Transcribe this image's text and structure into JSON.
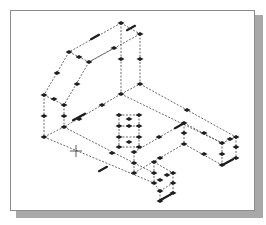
{
  "caption": "",
  "viewport": {
    "frame": {
      "x": 10,
      "y": 10,
      "w": 245,
      "h": 201,
      "border": "#8c8c8c",
      "shadow": "#a8a8a8"
    },
    "edge_color": "#444444",
    "grip_color": "#1e1e1e",
    "cursor": {
      "type": "crosshair",
      "x": 76,
      "y": 151
    }
  },
  "drawing": {
    "description": "Isometric wireframe of a bracket with all edges selected (dashed) showing grips",
    "edges": [
      [
        121,
        23,
        140,
        34
      ],
      [
        121,
        23,
        69,
        52
      ],
      [
        140,
        34,
        140,
        84
      ],
      [
        121,
        23,
        121,
        94
      ],
      [
        69,
        52,
        44,
        95
      ],
      [
        69,
        52,
        89,
        62
      ],
      [
        140,
        34,
        89,
        62
      ],
      [
        114,
        48,
        89,
        62
      ],
      [
        89,
        62,
        64,
        105
      ],
      [
        44,
        95,
        64,
        105
      ],
      [
        44,
        95,
        44,
        137
      ],
      [
        64,
        105,
        64,
        127
      ],
      [
        121,
        94,
        140,
        84
      ],
      [
        121,
        94,
        64,
        127
      ],
      [
        140,
        84,
        236,
        137
      ],
      [
        121,
        94,
        222,
        143
      ],
      [
        44,
        137,
        64,
        127
      ],
      [
        44,
        137,
        154,
        183
      ],
      [
        64,
        127,
        134,
        163
      ],
      [
        184,
        123,
        134,
        152
      ],
      [
        184,
        123,
        184,
        144
      ],
      [
        184,
        144,
        134,
        173
      ],
      [
        222,
        143,
        236,
        137
      ],
      [
        222,
        143,
        222,
        165
      ],
      [
        236,
        137,
        236,
        158
      ],
      [
        222,
        165,
        236,
        158
      ],
      [
        184,
        144,
        222,
        165
      ],
      [
        184,
        123,
        222,
        143
      ],
      [
        154,
        162,
        173,
        173
      ],
      [
        154,
        162,
        154,
        183
      ],
      [
        173,
        173,
        173,
        193
      ],
      [
        154,
        183,
        160,
        191
      ],
      [
        160,
        191,
        173,
        183
      ],
      [
        160,
        191,
        160,
        201
      ],
      [
        160,
        201,
        173,
        193
      ],
      [
        134,
        163,
        154,
        173
      ],
      [
        134,
        152,
        134,
        173
      ],
      [
        119,
        115,
        139,
        115
      ],
      [
        119,
        115,
        119,
        147
      ],
      [
        139,
        115,
        139,
        147
      ],
      [
        119,
        147,
        139,
        147
      ],
      [
        119,
        126,
        139,
        126
      ],
      [
        119,
        137,
        139,
        137
      ]
    ],
    "grips": [
      [
        121,
        23
      ],
      [
        140,
        34
      ],
      [
        114,
        48
      ],
      [
        121,
        59
      ],
      [
        140,
        59
      ],
      [
        69,
        52
      ],
      [
        79,
        57
      ],
      [
        89,
        62
      ],
      [
        57,
        73
      ],
      [
        77,
        84
      ],
      [
        140,
        84
      ],
      [
        44,
        95
      ],
      [
        54,
        99
      ],
      [
        64,
        105
      ],
      [
        121,
        94
      ],
      [
        102,
        105
      ],
      [
        44,
        116
      ],
      [
        64,
        116
      ],
      [
        79,
        119
      ],
      [
        64,
        127
      ],
      [
        44,
        137
      ],
      [
        119,
        115
      ],
      [
        129,
        119
      ],
      [
        139,
        115
      ],
      [
        119,
        126
      ],
      [
        129,
        126
      ],
      [
        139,
        126
      ],
      [
        119,
        137
      ],
      [
        129,
        142
      ],
      [
        139,
        137
      ],
      [
        119,
        147
      ],
      [
        139,
        147
      ],
      [
        134,
        152
      ],
      [
        134,
        163
      ],
      [
        134,
        173
      ],
      [
        112,
        153
      ],
      [
        159,
        137
      ],
      [
        187,
        110
      ],
      [
        184,
        123
      ],
      [
        184,
        133
      ],
      [
        184,
        144
      ],
      [
        204,
        133
      ],
      [
        204,
        154
      ],
      [
        222,
        143
      ],
      [
        230,
        139
      ],
      [
        236,
        137
      ],
      [
        236,
        147
      ],
      [
        222,
        154
      ],
      [
        236,
        158
      ],
      [
        222,
        165
      ],
      [
        154,
        162
      ],
      [
        160,
        158
      ],
      [
        154,
        173
      ],
      [
        160,
        180
      ],
      [
        167,
        175
      ],
      [
        173,
        173
      ],
      [
        154,
        183
      ],
      [
        173,
        183
      ],
      [
        160,
        191
      ],
      [
        173,
        193
      ],
      [
        160,
        201
      ]
    ],
    "dash_grips": [
      [
        131,
        28,
        4
      ],
      [
        95,
        37,
        4
      ],
      [
        79,
        117,
        6
      ],
      [
        103,
        169,
        4
      ],
      [
        179,
        126,
        4
      ],
      [
        228,
        162,
        5
      ],
      [
        166,
        197,
        5
      ]
    ]
  }
}
